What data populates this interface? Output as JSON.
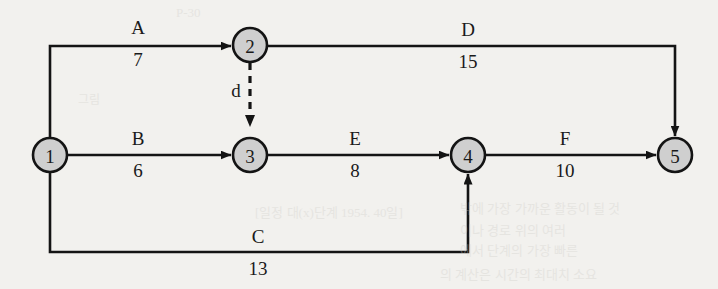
{
  "diagram": {
    "type": "directed-weighted-graph",
    "colors": {
      "node_fill": "#cfcfcf",
      "stroke": "#141414",
      "background": "#f2f1ee"
    },
    "nodes": [
      {
        "id": "1",
        "label": "1",
        "cx": 50,
        "cy": 155,
        "r": 17
      },
      {
        "id": "2",
        "label": "2",
        "cx": 250,
        "cy": 45,
        "r": 17
      },
      {
        "id": "3",
        "label": "3",
        "cx": 250,
        "cy": 155,
        "r": 17
      },
      {
        "id": "4",
        "label": "4",
        "cx": 468,
        "cy": 155,
        "r": 17
      },
      {
        "id": "5",
        "label": "5",
        "cx": 675,
        "cy": 155,
        "r": 17
      }
    ],
    "edges": [
      {
        "id": "A",
        "name": "A",
        "weight": "7",
        "from": "1",
        "to": "2",
        "style": "solid",
        "label_x": 138,
        "label_y": 34,
        "weight_x": 138,
        "weight_y": 64
      },
      {
        "id": "B",
        "name": "B",
        "weight": "6",
        "from": "1",
        "to": "3",
        "style": "solid",
        "label_x": 138,
        "label_y": 145,
        "weight_x": 138,
        "weight_y": 175
      },
      {
        "id": "C",
        "name": "C",
        "weight": "13",
        "from": "1",
        "to": "4",
        "style": "solid",
        "label_x": 258,
        "label_y": 243,
        "weight_x": 258,
        "weight_y": 273
      },
      {
        "id": "D",
        "name": "D",
        "weight": "15",
        "from": "2",
        "to": "5",
        "style": "solid",
        "label_x": 468,
        "label_y": 35,
        "weight_x": 468,
        "weight_y": 65
      },
      {
        "id": "E",
        "name": "E",
        "weight": "8",
        "from": "3",
        "to": "4",
        "style": "solid",
        "label_x": 355,
        "label_y": 145,
        "weight_x": 355,
        "weight_y": 175
      },
      {
        "id": "F",
        "name": "F",
        "weight": "10",
        "from": "4",
        "to": "5",
        "style": "solid",
        "label_x": 565,
        "label_y": 145,
        "weight_x": 565,
        "weight_y": 175
      },
      {
        "id": "d",
        "name": "d",
        "weight": "",
        "from": "2",
        "to": "3",
        "style": "dashed",
        "label_x": 238,
        "label_y": 96,
        "weight_x": 0,
        "weight_y": 0
      }
    ],
    "background_text": [
      {
        "text": "P-30",
        "x": 176,
        "y": 12,
        "size": 13
      },
      {
        "text": "그림",
        "x": 78,
        "y": 98,
        "size": 12
      },
      {
        "text": "[일정 대(x)단계 1954. 40일]",
        "x": 255,
        "y": 210,
        "size": 13
      },
      {
        "text": "밖에 가장 가까운 활동이 될 것",
        "x": 460,
        "y": 206,
        "size": 13
      },
      {
        "text": "이나 경로 위의 여러",
        "x": 460,
        "y": 228,
        "size": 13
      },
      {
        "text": "에서 단계의 가장 빠른",
        "x": 460,
        "y": 248,
        "size": 13
      },
      {
        "text": "의 계산은 시간의 최대치 소요",
        "x": 440,
        "y": 272,
        "size": 13
      }
    ]
  }
}
